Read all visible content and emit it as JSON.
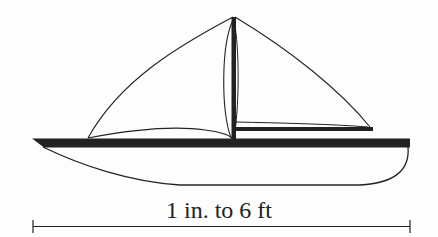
{
  "figure": {
    "scale_label": "1 in. to 6 ft"
  },
  "colors": {
    "ink": "#222222",
    "background": "#fdfdfd"
  }
}
